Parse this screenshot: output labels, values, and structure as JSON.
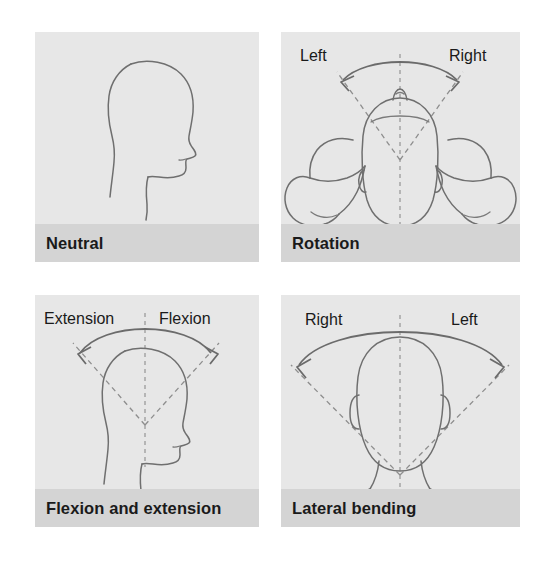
{
  "figure": {
    "background_color": "#ffffff",
    "panel_background": "#e7e7e7",
    "caption_bar_color": "#d4d4d4",
    "line_color": "#6f6f6f",
    "dash_color": "#8e8e8e",
    "text_color": "#1a1a1a"
  },
  "panels": [
    {
      "id": "neutral",
      "caption": "Neutral",
      "view": "lateral profile, facing right",
      "labels": [],
      "motion_arrows": 0
    },
    {
      "id": "rotation",
      "caption": "Rotation",
      "view": "superior / top-down with shoulders and arms",
      "labels": [
        {
          "text": "Left",
          "position": "top-left"
        },
        {
          "text": "Right",
          "position": "top-right"
        }
      ],
      "motion_arrows": 1,
      "arrow_type": "double-headed arc"
    },
    {
      "id": "flexion",
      "caption": "Flexion and extension",
      "view": "lateral profile, facing right",
      "labels": [
        {
          "text": "Extension",
          "position": "top-left"
        },
        {
          "text": "Flexion",
          "position": "top-right"
        }
      ],
      "motion_arrows": 1,
      "arrow_type": "double-headed arc"
    },
    {
      "id": "lateral",
      "caption": "Lateral bending",
      "view": "posterior / coronal with neck and shoulders",
      "labels": [
        {
          "text": "Right",
          "position": "top-left"
        },
        {
          "text": "Left",
          "position": "top-right"
        }
      ],
      "motion_arrows": 1,
      "arrow_type": "double-headed arc"
    }
  ]
}
